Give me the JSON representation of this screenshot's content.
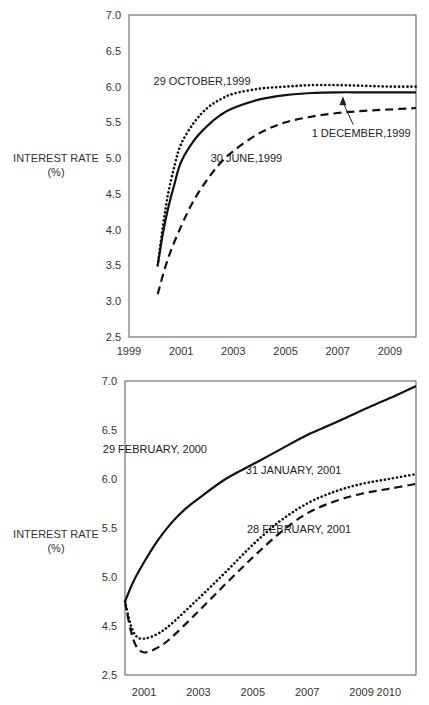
{
  "chart_data": [
    {
      "type": "line",
      "title": "",
      "xlabel": "",
      "ylabel": "INTEREST RATE",
      "ylabel_unit": "(%)",
      "xlim": [
        1999,
        2010
      ],
      "ylim": [
        2.5,
        7.0
      ],
      "x_ticks": [
        1999,
        2001,
        2003,
        2005,
        2007,
        2009
      ],
      "x_tick_labels": [
        "1999",
        "2001",
        "2003",
        "2005",
        "2007",
        "2009"
      ],
      "y_ticks": [
        2.5,
        3.0,
        3.5,
        4.0,
        4.5,
        5.0,
        5.5,
        6.0,
        6.5,
        7.0
      ],
      "y_tick_labels": [
        "2.5",
        "3.0",
        "3.5",
        "4.0",
        "4.5",
        "5.0",
        "5.5",
        "6.0",
        "6.5",
        "7.0"
      ],
      "grid": false,
      "series": [
        {
          "name": "29 OCTOBER,1999",
          "style": "dotted",
          "x": [
            2000.1,
            2000.3,
            2000.5,
            2000.75,
            2001,
            2001.5,
            2002,
            2002.5,
            2003,
            2004,
            2005,
            2006,
            2007,
            2008,
            2009,
            2010
          ],
          "values": [
            3.5,
            4.05,
            4.5,
            4.9,
            5.2,
            5.5,
            5.7,
            5.82,
            5.9,
            5.97,
            6.0,
            6.02,
            6.02,
            6.01,
            6.0,
            6.0
          ]
        },
        {
          "name": "1 DECEMBER,1999",
          "style": "solid",
          "x": [
            2000.1,
            2000.3,
            2000.5,
            2000.75,
            2001,
            2001.5,
            2002,
            2002.5,
            2003,
            2004,
            2005,
            2006,
            2007,
            2008,
            2009,
            2010
          ],
          "values": [
            3.5,
            3.95,
            4.3,
            4.65,
            4.95,
            5.25,
            5.45,
            5.6,
            5.7,
            5.82,
            5.88,
            5.91,
            5.92,
            5.92,
            5.92,
            5.92
          ]
        },
        {
          "name": "30 JUNE,1999",
          "style": "dashed",
          "x": [
            2000.1,
            2000.5,
            2001,
            2001.5,
            2002,
            2002.5,
            2003,
            2004,
            2005,
            2006,
            2007,
            2008,
            2009,
            2010
          ],
          "values": [
            3.1,
            3.6,
            4.05,
            4.42,
            4.7,
            4.93,
            5.1,
            5.35,
            5.5,
            5.58,
            5.63,
            5.66,
            5.68,
            5.7
          ]
        }
      ],
      "annotations": [
        {
          "text": "29 OCTOBER,1999",
          "x": 2001.8,
          "y": 6.02
        },
        {
          "text": "1 DECEMBER,1999",
          "x": 2007.9,
          "y": 5.3,
          "arrow_to": [
            2007.2,
            5.92
          ]
        },
        {
          "text": "30 JUNE,1999",
          "x": 2003.5,
          "y": 4.95
        }
      ]
    },
    {
      "type": "line",
      "title": "",
      "xlabel": "",
      "ylabel": "INTEREST RATE",
      "ylabel_unit": "(%)",
      "xlim": [
        2000.3,
        2011
      ],
      "ylim": [
        4.0,
        7.0
      ],
      "axis_break": "lowest tick labelled 2.5 (broken axis)",
      "x_ticks": [
        2001,
        2003,
        2005,
        2007,
        2009,
        2010
      ],
      "x_tick_labels": [
        "2001",
        "2003",
        "2005",
        "2007",
        "2009",
        "2010"
      ],
      "y_ticks": [
        4.0,
        4.5,
        5.0,
        5.5,
        6.0,
        6.5,
        7.0
      ],
      "y_tick_labels": [
        "2.5",
        "4.5",
        "5.0",
        "5.5",
        "6.0",
        "6.5",
        "7.0"
      ],
      "grid": false,
      "series": [
        {
          "name": "29 FEBRUARY, 2000",
          "style": "solid",
          "x": [
            2000.3,
            2000.6,
            2001,
            2001.5,
            2002,
            2002.5,
            2003,
            2004,
            2005,
            2006,
            2007,
            2008,
            2009,
            2010,
            2011
          ],
          "values": [
            4.75,
            4.95,
            5.15,
            5.37,
            5.55,
            5.69,
            5.8,
            6.0,
            6.15,
            6.3,
            6.45,
            6.57,
            6.7,
            6.82,
            6.95
          ]
        },
        {
          "name": "31 JANUARY, 2001",
          "style": "dotted",
          "x": [
            2000.3,
            2000.5,
            2000.7,
            2001,
            2001.5,
            2002,
            2003,
            2004,
            2005,
            2006,
            2007,
            2008,
            2009,
            2010,
            2011
          ],
          "values": [
            4.75,
            4.52,
            4.4,
            4.37,
            4.42,
            4.52,
            4.78,
            5.05,
            5.33,
            5.57,
            5.75,
            5.87,
            5.95,
            6.0,
            6.05
          ]
        },
        {
          "name": "28 FEBRUARY, 2001",
          "style": "dashed",
          "x": [
            2000.3,
            2000.5,
            2000.7,
            2001,
            2001.5,
            2002,
            2003,
            2004,
            2005,
            2006,
            2007,
            2008,
            2009,
            2010,
            2011
          ],
          "values": [
            4.75,
            4.47,
            4.3,
            4.23,
            4.28,
            4.38,
            4.65,
            4.93,
            5.2,
            5.45,
            5.65,
            5.77,
            5.85,
            5.9,
            5.95
          ]
        }
      ],
      "annotations": [
        {
          "text": "29 FEBRUARY, 2000",
          "x": 2001.4,
          "y": 6.27
        },
        {
          "text": "31 JANUARY, 2001",
          "x": 2006.5,
          "y": 6.05
        },
        {
          "text": "28 FEBRUARY, 2001",
          "x": 2006.7,
          "y": 5.45
        }
      ]
    }
  ]
}
